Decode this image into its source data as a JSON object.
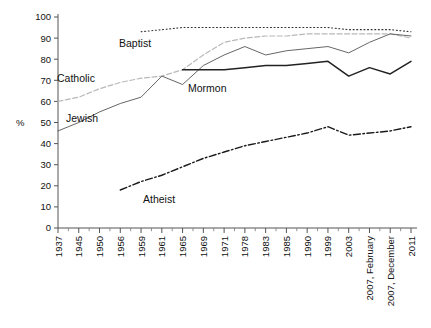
{
  "chart_data": {
    "type": "line",
    "title": "",
    "subtitle": "",
    "xlabel": "",
    "ylabel": "%",
    "ylim": [
      0,
      100
    ],
    "yticks": [
      0,
      10,
      20,
      30,
      40,
      50,
      60,
      70,
      80,
      90,
      100
    ],
    "grid": false,
    "legend_position": "inline-annotations",
    "categories": [
      "1937",
      "1945",
      "1950",
      "1956",
      "1959",
      "1961",
      "1965",
      "1969",
      "1971",
      "1978",
      "1983",
      "1985",
      "1990",
      "1999",
      "2003",
      "2007, February",
      "2007, December",
      "2011"
    ],
    "series": [
      {
        "name": "Baptist",
        "style": "dotted",
        "color": "#333333",
        "x": [
          "1959",
          "1961",
          "1965",
          "1969",
          "1971",
          "1978",
          "1983",
          "1985",
          "1990",
          "1999",
          "2003",
          "2007, February",
          "2007, December",
          "2011"
        ],
        "values": [
          93,
          94,
          95,
          95,
          95,
          95,
          95,
          95,
          95,
          95,
          94,
          94,
          94,
          93
        ]
      },
      {
        "name": "Catholic",
        "style": "dashed-light",
        "color": "#b8b8b8",
        "x": [
          "1937",
          "1945",
          "1950",
          "1956",
          "1959",
          "1961",
          "1965",
          "1969",
          "1971",
          "1978",
          "1983",
          "1985",
          "1990",
          "1999",
          "2003",
          "2007, February",
          "2007, December",
          "2011"
        ],
        "values": [
          60,
          62,
          66,
          69,
          71,
          72,
          75,
          82,
          88,
          90,
          91,
          91,
          92,
          92,
          92,
          92,
          92,
          90
        ]
      },
      {
        "name": "Jewish",
        "style": "solid-thin",
        "color": "#555555",
        "x": [
          "1937",
          "1945",
          "1950",
          "1956",
          "1959",
          "1961",
          "1965",
          "1969",
          "1971",
          "1978",
          "1983",
          "1985",
          "1990",
          "1999",
          "2003",
          "2007, February",
          "2007, December",
          "2011"
        ],
        "values": [
          46,
          50,
          55,
          59,
          62,
          72,
          68,
          77,
          82,
          86,
          82,
          84,
          85,
          86,
          83,
          88,
          92,
          91
        ]
      },
      {
        "name": "Mormon",
        "style": "solid-bold",
        "color": "#222222",
        "x": [
          "1965",
          "1969",
          "1971",
          "1978",
          "1983",
          "1985",
          "1990",
          "1999",
          "2003",
          "2007, February",
          "2007, December",
          "2011"
        ],
        "values": [
          75,
          75,
          75,
          76,
          77,
          77,
          78,
          79,
          72,
          76,
          73,
          79
        ]
      },
      {
        "name": "Atheist",
        "style": "dash-dot",
        "color": "#1a1a1a",
        "x": [
          "1956",
          "1959",
          "1961",
          "1965",
          "1969",
          "1971",
          "1978",
          "1983",
          "1985",
          "1990",
          "1999",
          "2003",
          "2007, February",
          "2007, December",
          "2011"
        ],
        "values": [
          18,
          22,
          25,
          29,
          33,
          36,
          39,
          41,
          43,
          45,
          48,
          44,
          45,
          46,
          48
        ]
      }
    ],
    "annotations": [
      {
        "text": "Baptist",
        "x_px": 119,
        "y_px": 47
      },
      {
        "text": "Catholic",
        "x_px": 57,
        "y_px": 82
      },
      {
        "text": "Jewish",
        "x_px": 66,
        "y_px": 122
      },
      {
        "text": "Mormon",
        "x_px": 188,
        "y_px": 92
      },
      {
        "text": "Atheist",
        "x_px": 143,
        "y_px": 203
      }
    ]
  },
  "axis": {
    "y_label": "%",
    "y_ticks": [
      "0",
      "10",
      "20",
      "30",
      "40",
      "50",
      "60",
      "70",
      "80",
      "90",
      "100"
    ],
    "x_ticks": [
      "1937",
      "1945",
      "1950",
      "1956",
      "1959",
      "1961",
      "1965",
      "1969",
      "1971",
      "1978",
      "1983",
      "1985",
      "1990",
      "1999",
      "2003",
      "2007, February",
      "2007, December",
      "2011"
    ]
  }
}
